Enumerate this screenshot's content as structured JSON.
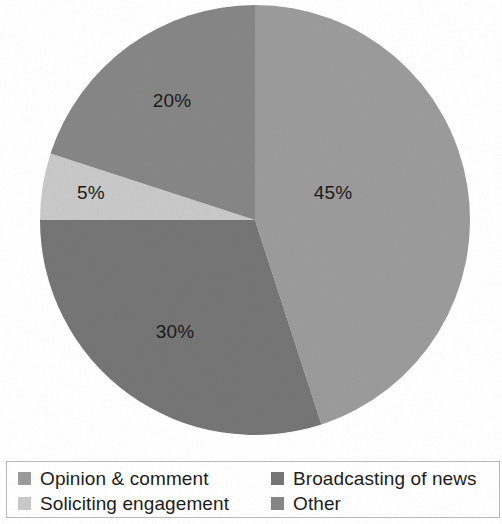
{
  "chart_data": {
    "type": "pie",
    "title": "",
    "subtitle": "",
    "xlabel": "",
    "ylabel": "",
    "grid": false,
    "legend_position": "bottom",
    "units": "percent",
    "start_angle_deg": 0,
    "direction": "clockwise",
    "categories": [
      "Opinion & comment",
      "Broadcasting of news",
      "Soliciting engagement",
      "Other"
    ],
    "values": [
      45,
      30,
      5,
      20
    ],
    "data_labels": [
      "45%",
      "30%",
      "5%",
      "20%"
    ],
    "colors": [
      "#9b9b9b",
      "#757575",
      "#c9c9c9",
      "#868686"
    ],
    "slices": [
      {
        "label": "Opinion & comment",
        "value": 45,
        "data_label": "45%",
        "color": "#9b9b9b",
        "start_deg": 0,
        "end_deg": 162,
        "label_x": 333,
        "label_y": 194
      },
      {
        "label": "Broadcasting of news",
        "value": 30,
        "data_label": "30%",
        "color": "#757575",
        "start_deg": 162,
        "end_deg": 270,
        "label_x": 175,
        "label_y": 333
      },
      {
        "label": "Soliciting engagement",
        "value": 5,
        "data_label": "5%",
        "color": "#c9c9c9",
        "start_deg": 270,
        "end_deg": 288,
        "label_x": 91,
        "label_y": 194
      },
      {
        "label": "Other",
        "value": 20,
        "data_label": "20%",
        "color": "#868686",
        "start_deg": 288,
        "end_deg": 360,
        "label_x": 172,
        "label_y": 102
      }
    ],
    "geometry": {
      "center_x": 255,
      "center_y": 220,
      "radius": 215
    }
  },
  "legend": {
    "entries": [
      {
        "label": "Opinion & comment",
        "color": "#9b9b9b"
      },
      {
        "label": "Broadcasting of news",
        "color": "#757575"
      },
      {
        "label": "Soliciting engagement",
        "color": "#c9c9c9"
      },
      {
        "label": "Other",
        "color": "#868686"
      }
    ]
  }
}
